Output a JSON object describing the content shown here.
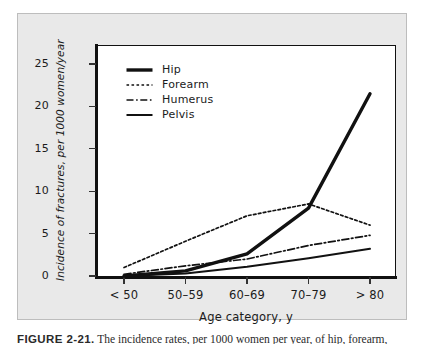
{
  "figure": {
    "background_color": "#e9e9e9",
    "plot_background_color": "#ffffff",
    "border_color": "#bdbdbd",
    "axis_color": "#111111",
    "caption_prefix": "FIGURE 2-21.",
    "caption_text": "The incidence rates, per 1000 women per year, of hip, forearm,"
  },
  "chart_data": {
    "type": "line",
    "title": "",
    "xlabel": "Age category, y",
    "ylabel": "Incidence of fractures, per 1000 women/year",
    "categories": [
      "< 50",
      "50–59",
      "60–69",
      "70–79",
      "> 80"
    ],
    "ylim": [
      0,
      27
    ],
    "yticks": [
      0,
      5,
      10,
      15,
      20,
      25
    ],
    "ytick_labels": [
      "0",
      "5",
      "10",
      "15",
      "20",
      "25"
    ],
    "grid": false,
    "legend_position": "upper-left-inside",
    "series": [
      {
        "name": "Hip",
        "style": "solid-thick",
        "values": [
          0.0,
          0.6,
          2.6,
          8.0,
          21.5
        ]
      },
      {
        "name": "Forearm",
        "style": "dotted",
        "values": [
          1.0,
          4.1,
          7.1,
          8.5,
          6.0
        ]
      },
      {
        "name": "Humerus",
        "style": "dash-dot",
        "values": [
          0.2,
          1.2,
          2.0,
          3.6,
          4.8
        ]
      },
      {
        "name": "Pelvis",
        "style": "solid-thin",
        "values": [
          0.0,
          0.3,
          1.1,
          2.1,
          3.2
        ]
      }
    ]
  },
  "legend": {
    "items": [
      {
        "label": "Hip"
      },
      {
        "label": "Forearm"
      },
      {
        "label": "Humerus"
      },
      {
        "label": "Pelvis"
      }
    ]
  }
}
